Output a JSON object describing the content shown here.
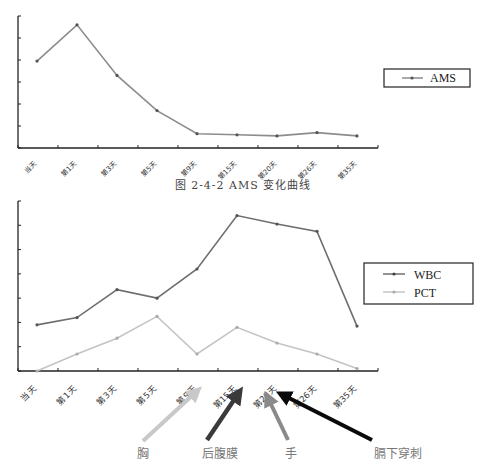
{
  "chart_data": [
    {
      "type": "line",
      "title": "图 2-4-2 AMS 变化曲线",
      "xlabel": "",
      "ylabel": "",
      "categories": [
        "当天",
        "第1天",
        "第3天",
        "第5天",
        "第9天",
        "第15天",
        "第20天",
        "第26天",
        "第35天"
      ],
      "series": [
        {
          "name": "AMS",
          "color": "#8c8c8c",
          "values": [
            3.95,
            5.6,
            3.3,
            1.7,
            0.65,
            0.6,
            0.55,
            0.7,
            0.55
          ]
        }
      ],
      "ylim": [
        0,
        6
      ],
      "y_ticks": 6,
      "y_tick_labels_visible": false,
      "grid": false,
      "legend_position": "right"
    },
    {
      "type": "line",
      "title": "",
      "xlabel": "",
      "ylabel": "",
      "categories": [
        "当天",
        "第1天",
        "第3天",
        "第5天",
        "第9天",
        "第15天",
        "第20天",
        "第26天",
        "第35天"
      ],
      "series": [
        {
          "name": "WBC",
          "color": "#6e6e6e",
          "values": [
            1.9,
            2.2,
            3.35,
            3.0,
            4.2,
            6.4,
            6.05,
            5.75,
            1.85
          ]
        },
        {
          "name": "PCT",
          "color": "#c4c4c4",
          "values": [
            0.0,
            0.7,
            1.35,
            2.25,
            0.7,
            1.8,
            1.15,
            0.7,
            0.1
          ]
        }
      ],
      "ylim": [
        0,
        7
      ],
      "y_ticks": 7,
      "y_tick_labels_visible": false,
      "grid": false,
      "legend_position": "right",
      "annotations": [
        {
          "label": "胸",
          "points_to": "第9天",
          "color": "#c8c8c8"
        },
        {
          "label": "后腹膜",
          "points_to": "第15天",
          "color": "#3a3a3a"
        },
        {
          "label": "手",
          "points_to": "第20天",
          "color": "#8a8a8a"
        },
        {
          "label": "膈下穿刺",
          "points_to": "第20天",
          "color": "#0a0a0a"
        }
      ]
    }
  ],
  "captions": {
    "figure1": "图 2-4-2   AMS 变化曲线"
  },
  "legend": {
    "chart1": [
      "AMS"
    ],
    "chart2": [
      "WBC",
      "PCT"
    ]
  },
  "x_labels": [
    "当天",
    "第1天",
    "第3天",
    "第5天",
    "第9天",
    "第15天",
    "第20天",
    "第26天",
    "第35天"
  ],
  "annotations": [
    "胸",
    "后腹膜",
    "手",
    "膈下穿刺"
  ]
}
